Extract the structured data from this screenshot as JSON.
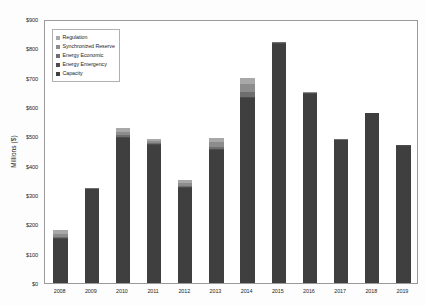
{
  "chart_data": {
    "type": "bar",
    "title": "",
    "subtitle": "",
    "xlabel": "",
    "ylabel": "Millions ($)",
    "categories": [
      "2008",
      "2009",
      "2010",
      "2011",
      "2012",
      "2013",
      "2014",
      "2015",
      "2016",
      "2017",
      "2018",
      "2019"
    ],
    "ylim": [
      0,
      900
    ],
    "ytick_labels": [
      "$0",
      "$100",
      "$200",
      "$300",
      "$400",
      "$500",
      "$600",
      "$700",
      "$800",
      "$900"
    ],
    "ytick_values": [
      0,
      100,
      200,
      300,
      400,
      500,
      600,
      700,
      800,
      900
    ],
    "grid": false,
    "stacked": true,
    "legend_position": "upper-left-inside",
    "series": [
      {
        "name": "Capacity",
        "color": "#3f3f3f",
        "values": [
          150,
          320,
          495,
          470,
          325,
          455,
          630,
          815,
          645,
          487,
          578,
          468
        ]
      },
      {
        "name": "Energy Emergency",
        "color": "#4d4d4d",
        "values": [
          2,
          2,
          3,
          3,
          2,
          3,
          4,
          3,
          2,
          2,
          2,
          2
        ]
      },
      {
        "name": "Energy Economic",
        "color": "#6e6e6e",
        "values": [
          4,
          2,
          6,
          5,
          4,
          6,
          16,
          2,
          2,
          1,
          1,
          1
        ]
      },
      {
        "name": "Synchronized Reserve",
        "color": "#8c8c8c",
        "values": [
          10,
          1,
          12,
          6,
          9,
          18,
          30,
          0,
          1,
          0,
          0,
          0
        ]
      },
      {
        "name": "Regulation",
        "color": "#a8a8a8",
        "values": [
          14,
          0,
          14,
          6,
          10,
          13,
          20,
          0,
          0,
          0,
          0,
          0
        ]
      }
    ],
    "totals": [
      180,
      325,
      530,
      490,
      350,
      495,
      700,
      820,
      650,
      490,
      581,
      471
    ]
  },
  "legend": {
    "items": [
      {
        "label": "Regulation",
        "color": "#a8a8a8"
      },
      {
        "label": "Synchronized Reserve",
        "color": "#8c8c8c"
      },
      {
        "label": "Energy Economic",
        "color": "#6e6e6e"
      },
      {
        "label": "Energy Emergency",
        "color": "#4d4d4d"
      },
      {
        "label": "Capacity",
        "color": "#3f3f3f"
      }
    ]
  },
  "colors": {
    "plot_border": "#9a9a9a",
    "background": "#ffffff",
    "text": "#262626"
  }
}
